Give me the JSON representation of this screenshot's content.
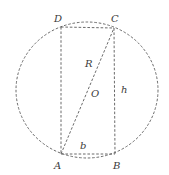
{
  "diagram": {
    "type": "geometry",
    "colors": {
      "stroke": "#5a5a5a",
      "label": "#3a3a3a",
      "background": "#ffffff"
    },
    "circle": {
      "center_label": "O",
      "cx": 87,
      "cy": 90,
      "rx": 71,
      "ry": 68,
      "style": "dashed"
    },
    "vertices": {
      "A": {
        "label": "A",
        "x": 61,
        "y": 154
      },
      "B": {
        "label": "B",
        "x": 115,
        "y": 154
      },
      "C": {
        "label": "C",
        "x": 114,
        "y": 28
      },
      "D": {
        "label": "D",
        "x": 61,
        "y": 27
      }
    },
    "labels": {
      "A": "A",
      "B": "B",
      "C": "C",
      "D": "D",
      "O": "O",
      "R": "R",
      "b": "b",
      "h": "h"
    },
    "edges": [
      {
        "from": "A",
        "to": "B",
        "label": "b",
        "style": "dashed"
      },
      {
        "from": "B",
        "to": "C",
        "label": "h",
        "style": "dashed"
      },
      {
        "from": "C",
        "to": "D",
        "style": "dashed"
      },
      {
        "from": "D",
        "to": "A",
        "style": "dashed"
      },
      {
        "from": "A",
        "to": "C",
        "label": "R",
        "style": "dashed",
        "note": "diagonal through O"
      }
    ]
  }
}
